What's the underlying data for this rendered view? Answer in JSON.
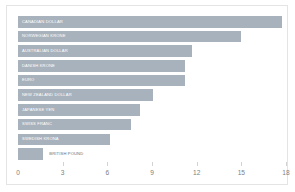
{
  "chart": {
    "type": "bar",
    "orientation": "horizontal",
    "background_color": "#ffffff",
    "border_color": "#e4e4e4",
    "bar_color": "#a8b2bd",
    "inside_label_color": "#ffffff",
    "outside_label_color": "#6e6e6e",
    "tick_label_color": "#808080"
  },
  "chart_data": {
    "type": "bar",
    "title": "",
    "subtitle": "",
    "xlabel": "",
    "ylabel": "",
    "grid": false,
    "legend": "none",
    "orientation": "horizontal",
    "xlim": [
      0,
      18
    ],
    "xticks": [
      0,
      3,
      6,
      9,
      12,
      15,
      18
    ],
    "xtick_labels": [
      "0",
      "3",
      "6",
      "9",
      "12",
      "15",
      "18"
    ],
    "categories": [
      "CANADIAN DOLLAR",
      "NORWEGIAN KRONE",
      "AUSTRALIAN DOLLAR",
      "DANISH KRONE",
      "EURO",
      "NEW ZEALAND DOLLAR",
      "JAPANESE YEN",
      "SWISS FRANC",
      "SWEDISH KRONA",
      "BRITISH POUND"
    ],
    "values": [
      17.7,
      15.0,
      11.7,
      11.2,
      11.2,
      9.1,
      8.2,
      7.6,
      6.2,
      1.7
    ],
    "bars": [
      {
        "label": "CANADIAN DOLLAR",
        "value": 17.7,
        "label_position": "inside"
      },
      {
        "label": "NORWEGIAN KRONE",
        "value": 15.0,
        "label_position": "inside"
      },
      {
        "label": "AUSTRALIAN DOLLAR",
        "value": 11.7,
        "label_position": "inside"
      },
      {
        "label": "DANISH KRONE",
        "value": 11.2,
        "label_position": "inside"
      },
      {
        "label": "EURO",
        "value": 11.2,
        "label_position": "inside"
      },
      {
        "label": "NEW ZEALAND DOLLAR",
        "value": 9.1,
        "label_position": "inside"
      },
      {
        "label": "JAPANESE YEN",
        "value": 8.2,
        "label_position": "inside"
      },
      {
        "label": "SWISS FRANC",
        "value": 7.6,
        "label_position": "inside"
      },
      {
        "label": "SWEDISH KRONA",
        "value": 6.2,
        "label_position": "inside"
      },
      {
        "label": "BRITISH POUND",
        "value": 1.7,
        "label_position": "outside"
      }
    ]
  }
}
